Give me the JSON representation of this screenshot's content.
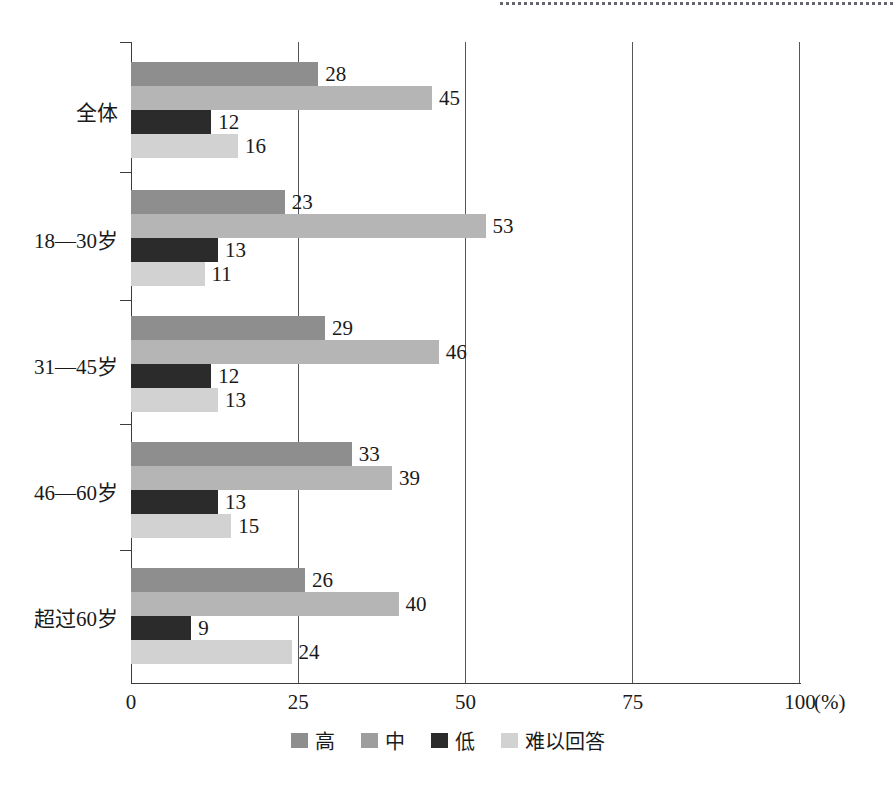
{
  "chart_data": {
    "type": "bar",
    "orientation": "horizontal",
    "title": "",
    "xlabel": "(%)",
    "ylabel": "",
    "xlim": [
      0,
      100
    ],
    "xticks": [
      "0",
      "25",
      "50",
      "75",
      "100"
    ],
    "xtick_values": [
      0,
      25,
      50,
      75,
      100
    ],
    "grid": true,
    "legend_position": "bottom",
    "categories": [
      "全体",
      "18—30岁",
      "31—45岁",
      "46—60岁",
      "超过60岁"
    ],
    "series": [
      {
        "name": "高",
        "values": [
          28,
          23,
          29,
          33,
          26
        ],
        "color": "#8e8e8e"
      },
      {
        "name": "中",
        "values": [
          45,
          53,
          46,
          39,
          40
        ],
        "color": "#b5b5b5"
      },
      {
        "name": "低",
        "values": [
          12,
          13,
          12,
          13,
          9
        ],
        "color": "#2b2b2b"
      },
      {
        "name": "难以回答",
        "values": [
          16,
          11,
          13,
          15,
          24
        ],
        "color": "#d2d2d2"
      }
    ]
  },
  "axis": {
    "unit_label": "(%)"
  },
  "legend": {
    "items": [
      "高",
      "中",
      "低",
      "难以回答"
    ]
  }
}
